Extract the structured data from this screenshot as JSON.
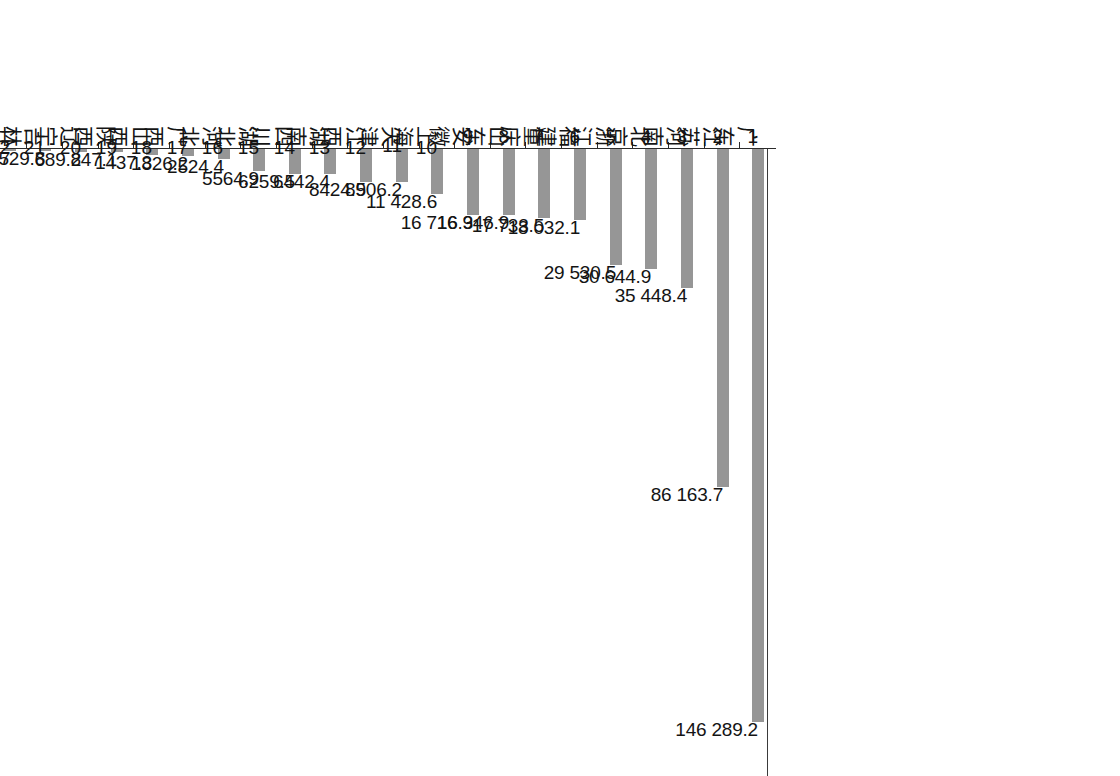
{
  "chart_data": {
    "type": "bar",
    "orientation": "vertical-rotated",
    "title": "",
    "subtitle": "",
    "xlabel": "",
    "ylabel": "",
    "ylim": [
      0,
      160000
    ],
    "grid": false,
    "legend": null,
    "tick_labels": [
      "0",
      "20 000",
      "40 000",
      "60 000",
      "80 000",
      "100 000",
      "120 000",
      "140 000",
      "160 000"
    ],
    "ticks": [
      0,
      20000,
      40000,
      60000,
      80000,
      100000,
      120000,
      140000,
      160000
    ],
    "categories": [
      "广东",
      "江苏",
      "河南",
      "北京",
      "浙江",
      "福建",
      "重庆",
      "山东",
      "安徽",
      "上海",
      "天津",
      "江西",
      "湖南",
      "四川",
      "湖北",
      "河北",
      "广西",
      "山西",
      "陕西",
      "辽宁",
      "吉林",
      "甘肃",
      "内蒙古",
      "宁夏",
      "贵州",
      "黑龙江",
      "云南",
      "海南",
      "青海",
      "新疆",
      "西藏"
    ],
    "ranks": [
      "1",
      "2",
      "3",
      "4",
      "5",
      "6",
      "7",
      "8",
      "9",
      "10",
      "11",
      "12",
      "13",
      "14",
      "15",
      "16",
      "17",
      "18",
      "19",
      "20",
      "21",
      "22",
      "23",
      "24",
      "25",
      "26",
      "27",
      "28",
      "29",
      "30",
      "30"
    ],
    "values": [
      146289.2,
      86163.7,
      35448.4,
      30644.9,
      29530.5,
      18032.1,
      17733.5,
      16946.9,
      16716.3,
      11428.6,
      8506.2,
      8424.9,
      6442.4,
      6259.5,
      5564.9,
      2524.4,
      1826.2,
      1437.3,
      847.1,
      689.2,
      529.8,
      420.7,
      194.9,
      158.2,
      94.0,
      86.5,
      78.9,
      13.6,
      0.3,
      0,
      0
    ],
    "value_labels": [
      "146 289.2",
      "86 163.7",
      "35 448.4",
      "30 644.9",
      "29 530.5",
      "18 032.1",
      "17 733.5",
      "16 946.9",
      "16 716.3",
      "11 428.6",
      "8506.2",
      "8424.9",
      "6442.4",
      "6259.5",
      "5564.9",
      "2524.4",
      "1826.2",
      "1437.3",
      "847.1",
      "689.2",
      "529.8",
      "420.7",
      "194.9",
      "158.2",
      "94.0",
      "86.5",
      "78.9",
      "13.6",
      "0.3",
      "0",
      "0"
    ],
    "bar_color": "#969696",
    "axis_color": "#2b2b2b"
  }
}
